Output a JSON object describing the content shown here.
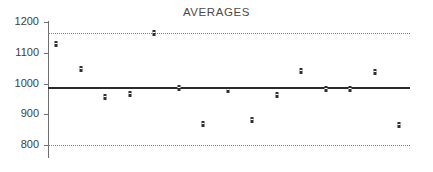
{
  "chart_data": {
    "type": "scatter",
    "title": "AVERAGES",
    "xlabel": "",
    "ylabel": "",
    "ylim": [
      780,
      1210
    ],
    "yticks": [
      800,
      900,
      1000,
      1100,
      1200
    ],
    "ytick_labels": [
      "800",
      "900",
      "1000",
      "1100",
      "1200"
    ],
    "grid": false,
    "legend": "none",
    "x": [
      1,
      2,
      3,
      4,
      5,
      6,
      7,
      8,
      9,
      10,
      11,
      12,
      13,
      14,
      15
    ],
    "values": [
      1127,
      1048,
      955,
      967,
      1163,
      985,
      868,
      978,
      880,
      962,
      1042,
      983,
      983,
      1038,
      865
    ],
    "reference_lines": [
      {
        "name": "upper-control-limit",
        "value": 1165,
        "style": "dotted"
      },
      {
        "name": "center-line",
        "value": 985,
        "style": "solid"
      },
      {
        "name": "lower-control-limit",
        "value": 800,
        "style": "dotted"
      }
    ]
  }
}
